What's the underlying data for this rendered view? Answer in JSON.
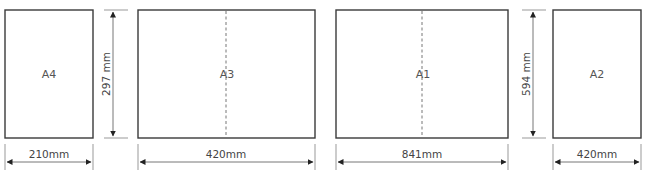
{
  "diagram": {
    "colors": {
      "sheet_stroke": "#3a3a3a",
      "dimension": "#777777",
      "text": "#555555"
    },
    "sheets": [
      {
        "id": "a4",
        "label": "A4",
        "width_label": "210mm",
        "height_label": "297 mm",
        "has_fold": false
      },
      {
        "id": "a3",
        "label": "A3",
        "width_label": "420mm",
        "has_fold": true
      },
      {
        "id": "a1",
        "label": "A1",
        "width_label": "841mm",
        "has_fold": true
      },
      {
        "id": "a2",
        "label": "A2",
        "width_label": "420mm",
        "height_label": "594 mm",
        "has_fold": false
      }
    ]
  }
}
